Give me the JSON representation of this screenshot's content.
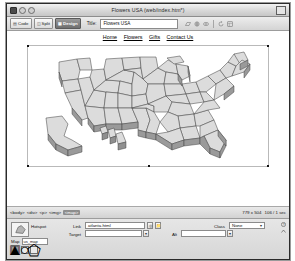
{
  "window": {
    "title": "Flowers USA (web/index.htm*)",
    "controls": [
      "close",
      "minimize",
      "zoom"
    ]
  },
  "toolbar": {
    "view_buttons": [
      {
        "label": "Code",
        "icon": "code-view-icon",
        "active": false
      },
      {
        "label": "Split",
        "icon": "split-view-icon",
        "active": false
      },
      {
        "label": "Design",
        "icon": "design-view-icon",
        "active": true
      }
    ],
    "title_label": "Title:",
    "title_value": "Flowers USA",
    "icons": [
      "file-management-icon",
      "preview-browser-icon",
      "refresh-design-view-icon",
      "view-options-icon",
      "visual-aids-icon"
    ]
  },
  "document": {
    "nav_links": [
      "Home",
      "Flowers",
      "Gifts",
      "Contact Us"
    ],
    "image_alt": "USA map with state hotspots"
  },
  "tag_selector": {
    "tags": [
      "<body>",
      "<div>",
      "<p>",
      "<img>",
      "<map>"
    ],
    "current_tag": "<map>",
    "status_size": "779 x 504",
    "status_weight": "106 / 1 sec"
  },
  "properties": {
    "panel_name": "Hotspot",
    "thumb_icon": "hotspot-polygon-icon",
    "link_label": "Link",
    "link_value": "atlanta.html",
    "link_browse_icon": "browse-folder-icon",
    "link_point_icon": "point-to-file-icon",
    "target_label": "Target",
    "target_value": "",
    "target_menu_icon": "target-dropdown-icon",
    "alt_label": "Alt",
    "alt_value": "",
    "alt_menu_icon": "alt-dropdown-icon",
    "class_label": "Class",
    "class_value": "None",
    "help_icon": "help-icon",
    "expand_icon": "expand-panel-icon"
  },
  "map_section": {
    "map_label": "Map",
    "map_value": "us_map",
    "tools": [
      {
        "name": "pointer-hotspot-tool",
        "glyph": "▲",
        "selected": true
      },
      {
        "name": "rectangle-hotspot-tool",
        "glyph": "□",
        "selected": false
      },
      {
        "name": "oval-hotspot-tool",
        "glyph": "○",
        "selected": false
      },
      {
        "name": "polygon-hotspot-tool",
        "glyph": "⬠",
        "selected": false
      }
    ]
  },
  "colors": {
    "window_chrome": "#d8d8d8",
    "active_tab": "#6f6f6f",
    "canvas": "#ffffff",
    "map_fill": "#d9d9d9",
    "map_stroke": "#4a4a4a"
  }
}
